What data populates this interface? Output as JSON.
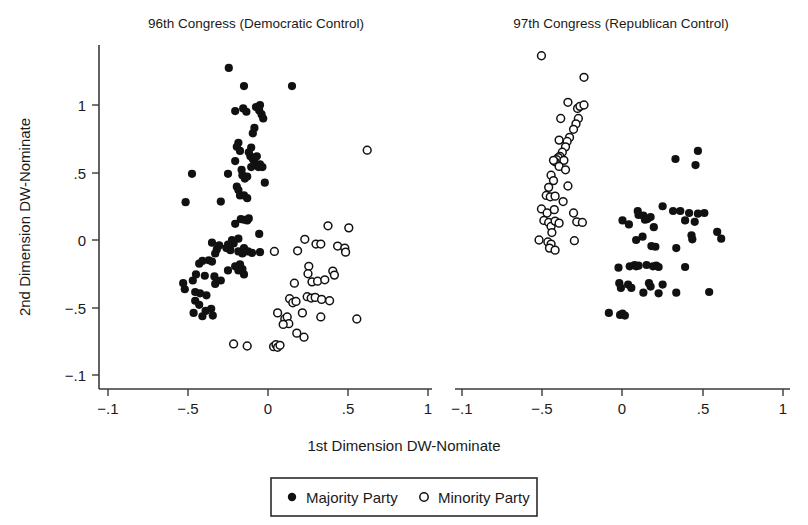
{
  "figure": {
    "xlabel": "1st Dimension DW-Nominate",
    "ylabel": "2nd Dimension DW-Nominate"
  },
  "legend": {
    "majority_label": "Majority Party",
    "minority_label": "Minority Party",
    "majority_marker": "filled-circle-icon",
    "minority_marker": "open-circle-icon"
  },
  "colors": {
    "ink": "#111111",
    "axis": "#3a3a3a",
    "background": "#ffffff"
  },
  "chart_data": [
    {
      "type": "scatter",
      "title": "96th Congress (Democratic Control)",
      "xlabel": "1st Dimension DW-Nominate",
      "ylabel": "2nd Dimension DW-Nominate",
      "xlim": [
        -1,
        1
      ],
      "ylim": [
        -1,
        1.4
      ],
      "xticks": [
        -1,
        -0.5,
        0,
        0.5,
        1
      ],
      "xticklabels": [
        "−.1",
        "−.5",
        "0",
        ".5",
        "1"
      ],
      "yticks": [
        1,
        0.5,
        0,
        -0.5,
        -1
      ],
      "yticklabels": [
        "1",
        ".5",
        "0",
        "−.5",
        "−.1"
      ],
      "grid": false,
      "legend_position": "below-figure",
      "series": [
        {
          "name": "Majority Party",
          "marker": "filled-circle",
          "points": [
            [
              -0.245,
              1.275
            ],
            [
              -0.15,
              1.14
            ],
            [
              0.15,
              1.14
            ],
            [
              -0.205,
              0.955
            ],
            [
              -0.155,
              0.975
            ],
            [
              -0.135,
              0.95
            ],
            [
              -0.075,
              0.985
            ],
            [
              -0.055,
              0.96
            ],
            [
              -0.04,
              0.93
            ],
            [
              -0.03,
              0.9
            ],
            [
              -0.05,
              1.0
            ],
            [
              -0.085,
              0.83
            ],
            [
              -0.095,
              0.79
            ],
            [
              -0.185,
              0.72
            ],
            [
              -0.195,
              0.69
            ],
            [
              -0.175,
              0.66
            ],
            [
              -0.105,
              0.685
            ],
            [
              -0.12,
              0.65
            ],
            [
              -0.11,
              0.62
            ],
            [
              -0.095,
              0.6
            ],
            [
              -0.085,
              0.575
            ],
            [
              -0.07,
              0.62
            ],
            [
              -0.05,
              0.56
            ],
            [
              -0.06,
              0.54
            ],
            [
              -0.205,
              0.585
            ],
            [
              -0.25,
              0.49
            ],
            [
              -0.165,
              0.52
            ],
            [
              -0.16,
              0.48
            ],
            [
              -0.145,
              0.455
            ],
            [
              -0.13,
              0.47
            ],
            [
              -0.105,
              0.54
            ],
            [
              -0.035,
              0.54
            ],
            [
              -0.02,
              0.425
            ],
            [
              -0.195,
              0.395
            ],
            [
              -0.185,
              0.37
            ],
            [
              -0.175,
              0.33
            ],
            [
              -0.15,
              0.33
            ],
            [
              -0.13,
              0.31
            ],
            [
              -0.295,
              0.285
            ],
            [
              -0.515,
              0.28
            ],
            [
              -0.475,
              0.49
            ],
            [
              -0.17,
              0.155
            ],
            [
              -0.15,
              0.15
            ],
            [
              -0.13,
              0.145
            ],
            [
              -0.12,
              0.16
            ],
            [
              -0.205,
              0.12
            ],
            [
              -0.055,
              0.045
            ],
            [
              -0.225,
              0.0
            ],
            [
              -0.215,
              -0.025
            ],
            [
              -0.185,
              0.01
            ],
            [
              -0.25,
              -0.035
            ],
            [
              -0.26,
              -0.06
            ],
            [
              -0.235,
              -0.075
            ],
            [
              -0.185,
              -0.085
            ],
            [
              -0.15,
              -0.06
            ],
            [
              -0.16,
              -0.1
            ],
            [
              -0.125,
              -0.085
            ],
            [
              -0.1,
              -0.095
            ],
            [
              -0.05,
              -0.09
            ],
            [
              -0.32,
              -0.07
            ],
            [
              -0.305,
              -0.04
            ],
            [
              -0.33,
              -0.1
            ],
            [
              -0.35,
              -0.02
            ],
            [
              -0.175,
              -0.18
            ],
            [
              -0.205,
              -0.195
            ],
            [
              -0.185,
              -0.225
            ],
            [
              -0.16,
              -0.215
            ],
            [
              -0.15,
              -0.255
            ],
            [
              -0.25,
              -0.225
            ],
            [
              -0.455,
              -0.45
            ],
            [
              -0.425,
              -0.395
            ],
            [
              -0.455,
              -0.385
            ],
            [
              -0.385,
              -0.41
            ],
            [
              -0.43,
              -0.48
            ],
            [
              -0.47,
              -0.3
            ],
            [
              -0.45,
              -0.255
            ],
            [
              -0.395,
              -0.265
            ],
            [
              -0.335,
              -0.27
            ],
            [
              -0.33,
              -0.325
            ],
            [
              -0.295,
              -0.3
            ],
            [
              -0.43,
              -0.175
            ],
            [
              -0.41,
              -0.155
            ],
            [
              -0.37,
              -0.15
            ],
            [
              -0.35,
              -0.16
            ],
            [
              -0.53,
              -0.32
            ],
            [
              -0.52,
              -0.365
            ],
            [
              -0.355,
              -0.51
            ],
            [
              -0.39,
              -0.525
            ],
            [
              -0.465,
              -0.54
            ],
            [
              -0.41,
              -0.565
            ],
            [
              -0.345,
              -0.56
            ]
          ]
        },
        {
          "name": "Minority Party",
          "marker": "open-circle",
          "points": [
            [
              0.62,
              0.665
            ],
            [
              0.375,
              0.105
            ],
            [
              0.505,
              0.09
            ],
            [
              0.23,
              0.005
            ],
            [
              0.3,
              -0.03
            ],
            [
              0.33,
              -0.03
            ],
            [
              0.435,
              -0.045
            ],
            [
              0.48,
              -0.06
            ],
            [
              0.485,
              -0.09
            ],
            [
              0.04,
              -0.085
            ],
            [
              0.185,
              -0.08
            ],
            [
              0.255,
              -0.195
            ],
            [
              0.25,
              -0.25
            ],
            [
              0.405,
              -0.23
            ],
            [
              0.415,
              -0.26
            ],
            [
              0.165,
              -0.32
            ],
            [
              0.275,
              -0.31
            ],
            [
              0.31,
              -0.305
            ],
            [
              0.355,
              -0.295
            ],
            [
              0.135,
              -0.435
            ],
            [
              0.155,
              -0.465
            ],
            [
              0.175,
              -0.455
            ],
            [
              0.245,
              -0.42
            ],
            [
              0.27,
              -0.43
            ],
            [
              0.295,
              -0.425
            ],
            [
              0.335,
              -0.44
            ],
            [
              0.385,
              -0.45
            ],
            [
              0.06,
              -0.54
            ],
            [
              0.105,
              -0.585
            ],
            [
              0.12,
              -0.57
            ],
            [
              0.13,
              -0.62
            ],
            [
              0.095,
              -0.625
            ],
            [
              0.215,
              -0.54
            ],
            [
              0.33,
              -0.57
            ],
            [
              0.555,
              -0.585
            ],
            [
              0.18,
              -0.69
            ],
            [
              -0.215,
              -0.77
            ],
            [
              -0.13,
              -0.785
            ],
            [
              0.035,
              -0.79
            ],
            [
              0.05,
              -0.775
            ],
            [
              0.06,
              -0.795
            ],
            [
              0.075,
              -0.78
            ],
            [
              0.225,
              -0.72
            ]
          ]
        }
      ]
    },
    {
      "type": "scatter",
      "title": "97th Congress (Republican Control)",
      "xlabel": "1st Dimension DW-Nominate",
      "ylabel": "2nd Dimension DW-Nominate",
      "xlim": [
        -1,
        1
      ],
      "ylim": [
        -1,
        1.4
      ],
      "xticks": [
        -1,
        -0.5,
        0,
        0.5,
        1
      ],
      "xticklabels": [
        "−.1",
        "−.5",
        "0",
        ".5",
        "1"
      ],
      "yticks": [
        1,
        0.5,
        0,
        -0.5,
        -1
      ],
      "yticklabels": [
        "1",
        ".5",
        "0",
        "−.5",
        "−.1"
      ],
      "grid": false,
      "legend_position": "below-figure",
      "series": [
        {
          "name": "Majority Party",
          "marker": "filled-circle",
          "points": [
            [
              0.33,
              0.6
            ],
            [
              0.47,
              0.66
            ],
            [
              0.455,
              0.555
            ],
            [
              0.095,
              0.215
            ],
            [
              0.1,
              0.185
            ],
            [
              0.13,
              0.18
            ],
            [
              0.14,
              0.15
            ],
            [
              0.155,
              0.155
            ],
            [
              0.175,
              0.17
            ],
            [
              0.25,
              0.25
            ],
            [
              0.315,
              0.215
            ],
            [
              0.36,
              0.215
            ],
            [
              0.415,
              0.2
            ],
            [
              0.47,
              0.195
            ],
            [
              0.51,
              0.2
            ],
            [
              0.39,
              0.145
            ],
            [
              0.45,
              0.135
            ],
            [
              0.0,
              0.145
            ],
            [
              0.04,
              0.115
            ],
            [
              0.195,
              0.095
            ],
            [
              0.125,
              0.025
            ],
            [
              0.085,
              0.0
            ],
            [
              0.43,
              0.035
            ],
            [
              0.435,
              0.005
            ],
            [
              0.18,
              -0.045
            ],
            [
              0.205,
              -0.05
            ],
            [
              0.335,
              -0.06
            ],
            [
              -0.025,
              -0.205
            ],
            [
              0.045,
              -0.195
            ],
            [
              0.075,
              -0.185
            ],
            [
              0.1,
              -0.19
            ],
            [
              0.15,
              -0.185
            ],
            [
              0.19,
              -0.195
            ],
            [
              0.21,
              -0.19
            ],
            [
              0.225,
              -0.2
            ],
            [
              0.39,
              -0.2
            ],
            [
              -0.02,
              -0.32
            ],
            [
              -0.01,
              -0.355
            ],
            [
              0.035,
              -0.33
            ],
            [
              0.055,
              -0.355
            ],
            [
              0.165,
              -0.32
            ],
            [
              0.175,
              -0.345
            ],
            [
              0.25,
              -0.33
            ],
            [
              0.13,
              -0.39
            ],
            [
              0.225,
              -0.395
            ],
            [
              0.335,
              -0.39
            ],
            [
              0.54,
              -0.385
            ],
            [
              0.085,
              -0.195
            ],
            [
              -0.085,
              -0.54
            ],
            [
              -0.015,
              -0.555
            ],
            [
              0.0,
              -0.545
            ],
            [
              0.015,
              -0.56
            ],
            [
              0.59,
              0.06
            ],
            [
              0.615,
              0.01
            ]
          ]
        },
        {
          "name": "Minority Party",
          "marker": "open-circle",
          "points": [
            [
              -0.505,
              1.365
            ],
            [
              -0.24,
              1.205
            ],
            [
              -0.34,
              1.02
            ],
            [
              -0.28,
              0.975
            ],
            [
              -0.265,
              0.99
            ],
            [
              -0.24,
              1.0
            ],
            [
              -0.385,
              0.9
            ],
            [
              -0.275,
              0.9
            ],
            [
              -0.29,
              0.86
            ],
            [
              -0.305,
              0.82
            ],
            [
              -0.33,
              0.76
            ],
            [
              -0.345,
              0.73
            ],
            [
              -0.395,
              0.74
            ],
            [
              -0.355,
              0.69
            ],
            [
              -0.375,
              0.65
            ],
            [
              -0.39,
              0.62
            ],
            [
              -0.4,
              0.61
            ],
            [
              -0.41,
              0.595
            ],
            [
              -0.42,
              0.58
            ],
            [
              -0.43,
              0.59
            ],
            [
              -0.365,
              0.59
            ],
            [
              -0.395,
              0.545
            ],
            [
              -0.355,
              0.52
            ],
            [
              -0.445,
              0.48
            ],
            [
              -0.43,
              0.44
            ],
            [
              -0.46,
              0.39
            ],
            [
              -0.34,
              0.4
            ],
            [
              -0.475,
              0.33
            ],
            [
              -0.45,
              0.32
            ],
            [
              -0.42,
              0.325
            ],
            [
              -0.37,
              0.285
            ],
            [
              -0.505,
              0.23
            ],
            [
              -0.47,
              0.2
            ],
            [
              -0.425,
              0.225
            ],
            [
              -0.49,
              0.145
            ],
            [
              -0.46,
              0.13
            ],
            [
              -0.445,
              0.1
            ],
            [
              -0.42,
              0.14
            ],
            [
              -0.395,
              0.125
            ],
            [
              -0.44,
              0.055
            ],
            [
              -0.52,
              0.0
            ],
            [
              -0.465,
              -0.015
            ],
            [
              -0.445,
              -0.03
            ],
            [
              -0.455,
              -0.06
            ],
            [
              -0.42,
              -0.075
            ],
            [
              -0.305,
              0.2
            ],
            [
              -0.3,
              -0.005
            ],
            [
              -0.285,
              0.135
            ],
            [
              -0.25,
              0.13
            ]
          ]
        }
      ]
    }
  ]
}
